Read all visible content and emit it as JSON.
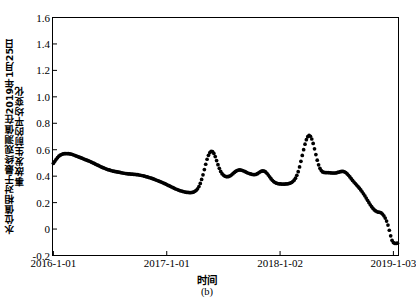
{
  "chart_data": {
    "type": "scatter",
    "title": "",
    "caption": "(b)",
    "xlabel": "时间",
    "ylabel_line1": "水位值相对于最终观测值在2019年1月25日",
    "ylabel_line2": "事故发生前的平均变化",
    "marker": "filled-circle",
    "marker_color": "#000000",
    "grid": false,
    "legend": null,
    "ylim": [
      -0.2,
      1.6
    ],
    "yticks": [
      "1.6",
      "1.4",
      "1.2",
      "1.0",
      "0.8",
      "0.6",
      "0.4",
      "0.2",
      "0",
      "-0.2"
    ],
    "ytick_values": [
      1.6,
      1.4,
      1.2,
      1.0,
      0.8,
      0.6,
      0.4,
      0.2,
      0.0,
      -0.2
    ],
    "xticks": [
      "2016-1-01",
      "2017-1-01",
      "2018-1-02",
      "2019-1-03"
    ],
    "xtick_values": [
      0.0,
      1.0,
      2.0,
      3.0
    ],
    "xlim": [
      -0.008,
      3.045
    ],
    "x": [
      0.0,
      0.012,
      0.024,
      0.036,
      0.048,
      0.06,
      0.072,
      0.084,
      0.096,
      0.108,
      0.12,
      0.132,
      0.144,
      0.156,
      0.168,
      0.18,
      0.192,
      0.204,
      0.216,
      0.228,
      0.24,
      0.252,
      0.264,
      0.276,
      0.288,
      0.3,
      0.312,
      0.324,
      0.336,
      0.348,
      0.36,
      0.372,
      0.384,
      0.396,
      0.408,
      0.42,
      0.432,
      0.444,
      0.456,
      0.468,
      0.48,
      0.492,
      0.504,
      0.516,
      0.528,
      0.54,
      0.552,
      0.564,
      0.576,
      0.588,
      0.6,
      0.612,
      0.624,
      0.636,
      0.648,
      0.66,
      0.672,
      0.684,
      0.696,
      0.708,
      0.72,
      0.732,
      0.744,
      0.756,
      0.768,
      0.78,
      0.792,
      0.804,
      0.816,
      0.828,
      0.84,
      0.852,
      0.864,
      0.876,
      0.888,
      0.9,
      0.912,
      0.924,
      0.936,
      0.948,
      0.96,
      0.972,
      0.984,
      0.996,
      1.008,
      1.02,
      1.032,
      1.044,
      1.056,
      1.068,
      1.08,
      1.092,
      1.104,
      1.116,
      1.128,
      1.14,
      1.152,
      1.164,
      1.176,
      1.188,
      1.2,
      1.212,
      1.224,
      1.236,
      1.248,
      1.26,
      1.272,
      1.284,
      1.296,
      1.308,
      1.32,
      1.332,
      1.344,
      1.356,
      1.368,
      1.38,
      1.392,
      1.404,
      1.416,
      1.428,
      1.44,
      1.452,
      1.464,
      1.476,
      1.488,
      1.5,
      1.512,
      1.524,
      1.536,
      1.548,
      1.56,
      1.572,
      1.584,
      1.596,
      1.608,
      1.62,
      1.632,
      1.644,
      1.656,
      1.668,
      1.68,
      1.692,
      1.704,
      1.716,
      1.728,
      1.74,
      1.752,
      1.764,
      1.776,
      1.788,
      1.8,
      1.812,
      1.824,
      1.836,
      1.848,
      1.86,
      1.872,
      1.884,
      1.896,
      1.908,
      1.92,
      1.932,
      1.944,
      1.956,
      1.968,
      1.98,
      1.992,
      2.004,
      2.016,
      2.028,
      2.04,
      2.052,
      2.064,
      2.076,
      2.088,
      2.1,
      2.112,
      2.124,
      2.136,
      2.148,
      2.16,
      2.172,
      2.184,
      2.196,
      2.208,
      2.22,
      2.232,
      2.244,
      2.256,
      2.268,
      2.28,
      2.292,
      2.304,
      2.316,
      2.328,
      2.34,
      2.352,
      2.364,
      2.376,
      2.388,
      2.4,
      2.412,
      2.424,
      2.436,
      2.448,
      2.46,
      2.472,
      2.484,
      2.496,
      2.508,
      2.52,
      2.532,
      2.544,
      2.556,
      2.568,
      2.58,
      2.592,
      2.604,
      2.616,
      2.628,
      2.64,
      2.652,
      2.664,
      2.676,
      2.688,
      2.7,
      2.712,
      2.724,
      2.736,
      2.748,
      2.76,
      2.772,
      2.784,
      2.796,
      2.808,
      2.82,
      2.832,
      2.844,
      2.856,
      2.868,
      2.88,
      2.892,
      2.904,
      2.916,
      2.928,
      2.94,
      2.952,
      2.964,
      2.976,
      2.988,
      3.0,
      3.012,
      3.024,
      3.036
    ],
    "y": [
      0.497,
      0.512,
      0.527,
      0.54,
      0.551,
      0.559,
      0.564,
      0.568,
      0.57,
      0.571,
      0.571,
      0.57,
      0.569,
      0.567,
      0.564,
      0.56,
      0.556,
      0.552,
      0.548,
      0.544,
      0.54,
      0.536,
      0.531,
      0.527,
      0.523,
      0.519,
      0.515,
      0.511,
      0.506,
      0.501,
      0.496,
      0.491,
      0.486,
      0.481,
      0.476,
      0.471,
      0.466,
      0.462,
      0.458,
      0.454,
      0.45,
      0.447,
      0.444,
      0.441,
      0.438,
      0.436,
      0.434,
      0.432,
      0.43,
      0.428,
      0.426,
      0.424,
      0.422,
      0.42,
      0.419,
      0.418,
      0.417,
      0.416,
      0.415,
      0.414,
      0.413,
      0.412,
      0.411,
      0.409,
      0.407,
      0.405,
      0.403,
      0.4,
      0.397,
      0.394,
      0.391,
      0.388,
      0.385,
      0.381,
      0.377,
      0.373,
      0.369,
      0.365,
      0.361,
      0.357,
      0.352,
      0.348,
      0.343,
      0.338,
      0.333,
      0.328,
      0.323,
      0.318,
      0.313,
      0.308,
      0.303,
      0.299,
      0.295,
      0.291,
      0.288,
      0.285,
      0.282,
      0.28,
      0.278,
      0.277,
      0.276,
      0.276,
      0.277,
      0.28,
      0.285,
      0.293,
      0.305,
      0.322,
      0.345,
      0.375,
      0.41,
      0.45,
      0.49,
      0.528,
      0.558,
      0.578,
      0.588,
      0.586,
      0.572,
      0.548,
      0.518,
      0.487,
      0.459,
      0.436,
      0.419,
      0.408,
      0.401,
      0.397,
      0.396,
      0.398,
      0.403,
      0.41,
      0.419,
      0.428,
      0.436,
      0.442,
      0.446,
      0.447,
      0.446,
      0.443,
      0.439,
      0.434,
      0.429,
      0.424,
      0.42,
      0.417,
      0.414,
      0.412,
      0.412,
      0.414,
      0.419,
      0.426,
      0.433,
      0.438,
      0.44,
      0.438,
      0.432,
      0.422,
      0.409,
      0.395,
      0.381,
      0.369,
      0.359,
      0.352,
      0.347,
      0.344,
      0.342,
      0.341,
      0.34,
      0.34,
      0.34,
      0.341,
      0.342,
      0.344,
      0.347,
      0.352,
      0.359,
      0.37,
      0.385,
      0.406,
      0.434,
      0.47,
      0.512,
      0.557,
      0.6,
      0.642,
      0.676,
      0.699,
      0.708,
      0.702,
      0.681,
      0.648,
      0.607,
      0.563,
      0.521,
      0.486,
      0.459,
      0.442,
      0.432,
      0.428,
      0.427,
      0.427,
      0.427,
      0.426,
      0.425,
      0.424,
      0.424,
      0.424,
      0.425,
      0.428,
      0.431,
      0.434,
      0.436,
      0.436,
      0.433,
      0.427,
      0.418,
      0.407,
      0.394,
      0.381,
      0.368,
      0.356,
      0.344,
      0.333,
      0.321,
      0.309,
      0.296,
      0.282,
      0.267,
      0.251,
      0.234,
      0.217,
      0.2,
      0.184,
      0.169,
      0.156,
      0.145,
      0.137,
      0.131,
      0.128,
      0.127,
      0.122,
      0.113,
      0.1,
      0.083,
      0.06,
      0.03,
      -0.009,
      -0.051,
      -0.085,
      -0.102,
      -0.108,
      -0.109,
      -0.107
    ]
  }
}
